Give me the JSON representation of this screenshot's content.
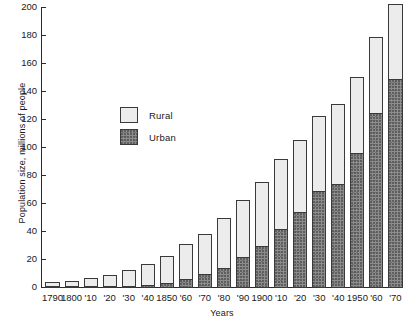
{
  "chart_data": {
    "type": "bar",
    "title": "",
    "subtitle": "",
    "xlabel": "Years",
    "ylabel": "Population size, millions of people",
    "stacked": true,
    "grid": false,
    "legend_position": "inside-upper-left",
    "ylim": [
      0,
      200
    ],
    "ytick_labels": [
      "0",
      "20",
      "40",
      "60",
      "80",
      "100",
      "120",
      "140",
      "160",
      "180",
      "200"
    ],
    "ytick_values": [
      0,
      20,
      40,
      60,
      80,
      100,
      120,
      140,
      160,
      180,
      200
    ],
    "categories": [
      "1790",
      "1800",
      "'10",
      "'20",
      "'30",
      "'40",
      "1850",
      "'60",
      "'70",
      "'80",
      "'90",
      "1900",
      "'10",
      "'20",
      "'30",
      "'40",
      "1950",
      "'60",
      "'70"
    ],
    "series": [
      {
        "name": "Urban",
        "color": "#8d8d8d",
        "values": [
          0.2,
          0.3,
          0.5,
          0.7,
          1.1,
          1.8,
          3.5,
          6.2,
          9.9,
          14.1,
          22.1,
          30.2,
          42.0,
          54.2,
          69.0,
          74.4,
          96.5,
          125.3,
          149.3
        ]
      },
      {
        "name": "Rural",
        "color": "#ececec",
        "values": [
          3.7,
          5.0,
          6.7,
          8.9,
          11.7,
          15.2,
          19.6,
          25.2,
          28.6,
          36.0,
          40.8,
          45.8,
          50.0,
          51.6,
          53.8,
          57.2,
          54.2,
          54.1,
          53.9
        ]
      }
    ],
    "totals": [
      4.0,
      5.3,
      7.2,
      9.6,
      12.9,
      17.1,
      23.2,
      31.4,
      38.6,
      50.2,
      62.9,
      76.0,
      92.0,
      105.7,
      122.8,
      131.7,
      150.7,
      179.3,
      203.2
    ]
  },
  "legend": {
    "items": [
      {
        "label": "Rural"
      },
      {
        "label": "Urban"
      }
    ]
  },
  "axis": {
    "x_title": "Years",
    "y_title": "Population size, millions of people"
  }
}
